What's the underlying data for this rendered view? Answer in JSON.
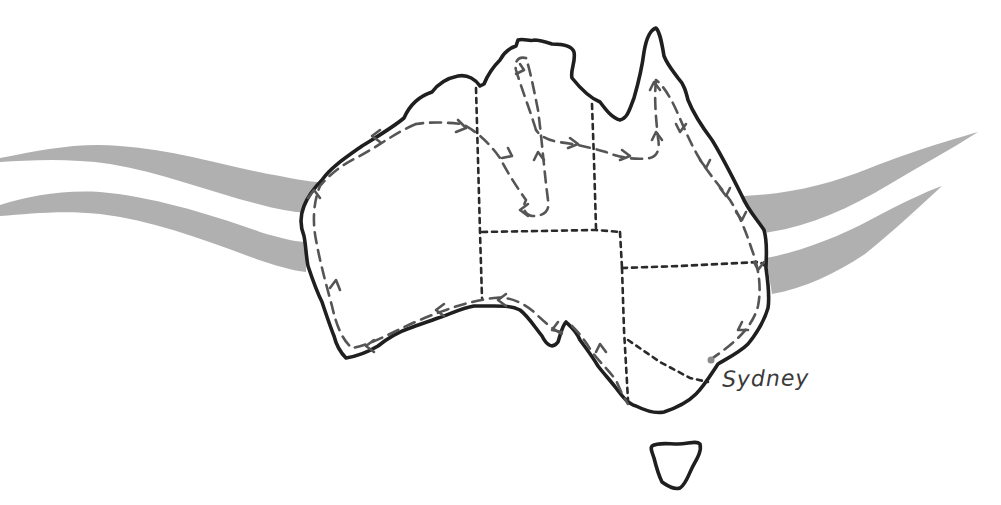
{
  "map": {
    "title": "",
    "region": "Australia",
    "style": "hand-drawn sketch",
    "colors": {
      "coastline": "#1f1f1f",
      "state_borders": "#2a2a2a",
      "route": "#555555",
      "wind_streaks": "#a9a9a9",
      "background": "#ffffff"
    },
    "labels": {
      "city": "Sydney"
    },
    "markers": [
      {
        "name": "Sydney",
        "type": "city-dot"
      }
    ],
    "features": {
      "mainland": "Australia",
      "island": "Tasmania",
      "route": "dashed route with arrows circling the coast and looping through the interior",
      "streaks_west": 2,
      "streaks_east": 2
    }
  }
}
